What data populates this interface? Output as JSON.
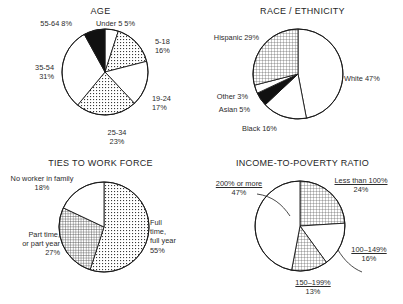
{
  "figure": {
    "background": "#ffffff",
    "outline_color": "#1a1a1a",
    "panels": [
      "AGE",
      "RACE / ETHNICITY",
      "TIES TO WORK FORCE",
      "INCOME-TO-POVERTY RATIO"
    ]
  },
  "age": {
    "title": "AGE",
    "labels": {
      "under5_name": "Under 5",
      "under5_pct": "5%",
      "a5_18_name": "5-18",
      "a5_18_pct": "16%",
      "a19_24_name": "19-24",
      "a19_24_pct": "17%",
      "a25_34_name": "25-34",
      "a25_34_pct": "23%",
      "a35_54_name": "35-54",
      "a35_54_pct": "31%",
      "a55_64_name": "55-64",
      "a55_64_pct": "8%"
    }
  },
  "race": {
    "title": "RACE / ETHNICITY",
    "labels": {
      "white": "White 47%",
      "black": "Black 16%",
      "asian": "Asian 5%",
      "other": "Other 3%",
      "hispanic": "Hispanic 29%"
    }
  },
  "ties": {
    "title": "TIES TO WORK FORCE",
    "labels": {
      "full_l1": "Full",
      "full_l2": "time,",
      "full_l3": "full year",
      "full_pct": "55%",
      "part_l1": "Part time,",
      "part_l2": "or part year",
      "part_pct": "27%",
      "none_l1": "No worker in family",
      "none_pct": "18%"
    }
  },
  "income": {
    "title": "INCOME-TO-POVERTY RATIO",
    "labels": {
      "lt100_name": "Less than 100%",
      "lt100_pct": "24%",
      "r100_149_name": "100–149%",
      "r100_149_pct": "16%",
      "r150_199_name": "150–199%",
      "r150_199_pct": "13%",
      "ge200_name": "200% or more",
      "ge200_pct": "47%"
    }
  },
  "chart_data": [
    {
      "type": "pie",
      "title": "AGE",
      "categories": [
        "Under 5",
        "5-18",
        "19-24",
        "25-34",
        "35-54",
        "55-64"
      ],
      "values": [
        5,
        16,
        17,
        23,
        31,
        8
      ],
      "unit": "percent",
      "start_angle_deg": 0,
      "direction": "clockwise",
      "fills": [
        "white",
        "dotted-fine",
        "white",
        "dotted-fine",
        "white",
        "black"
      ],
      "legend": "labels-outside"
    },
    {
      "type": "pie",
      "title": "RACE / ETHNICITY",
      "categories": [
        "White",
        "Black",
        "Asian",
        "Other",
        "Hispanic"
      ],
      "values": [
        47,
        16,
        5,
        3,
        29
      ],
      "unit": "percent",
      "start_angle_deg": 0,
      "direction": "clockwise",
      "fills": [
        "white",
        "white",
        "black",
        "white",
        "crosshatch"
      ],
      "legend": "labels-outside"
    },
    {
      "type": "pie",
      "title": "TIES TO WORK FORCE",
      "categories": [
        "Full time, full year",
        "Part time, or part year",
        "No worker in family"
      ],
      "values": [
        55,
        27,
        18
      ],
      "unit": "percent",
      "start_angle_deg": 0,
      "direction": "clockwise",
      "fills": [
        "dotted-fine",
        "crosshatch",
        "white"
      ],
      "legend": "labels-outside"
    },
    {
      "type": "pie",
      "title": "INCOME-TO-POVERTY RATIO",
      "categories": [
        "Less than 100%",
        "100–149%",
        "150–199%",
        "200% or more"
      ],
      "values": [
        24,
        16,
        13,
        47
      ],
      "unit": "percent",
      "start_angle_deg": 0,
      "direction": "clockwise",
      "fills": [
        "crosshatch",
        "white",
        "crosshatch",
        "white"
      ],
      "legend": "labels-outside"
    }
  ]
}
